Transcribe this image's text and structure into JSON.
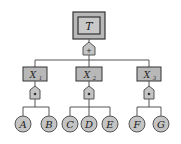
{
  "diagram": {
    "type": "fault-tree",
    "top_event": {
      "label": "T"
    },
    "top_gate": {
      "symbol": "+",
      "type": "OR"
    },
    "intermediate": [
      {
        "label": "X",
        "sub": "1",
        "gate_symbol": "•",
        "gate_type": "AND",
        "children": [
          "A",
          "B"
        ]
      },
      {
        "label": "X",
        "sub": "2",
        "gate_symbol": "•",
        "gate_type": "AND",
        "children": [
          "C",
          "D",
          "E"
        ]
      },
      {
        "label": "X",
        "sub": "3",
        "gate_symbol": "•",
        "gate_type": "AND",
        "children": [
          "F",
          "G"
        ]
      }
    ],
    "colors": {
      "box_fill": "#b8b8b8",
      "line": "#555555",
      "circle_fill": "#c4c4c4"
    }
  }
}
